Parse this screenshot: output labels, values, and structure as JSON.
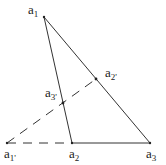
{
  "diagram": {
    "points": {
      "a1": {
        "x": 44,
        "y": 17,
        "label": "a",
        "sub": "1"
      },
      "a2": {
        "x": 72,
        "y": 143,
        "label": "a",
        "sub": "2"
      },
      "a3": {
        "x": 150,
        "y": 143,
        "label": "a",
        "sub": "3"
      },
      "a1p": {
        "x": 7,
        "y": 143,
        "label": "a",
        "sub": "1'"
      },
      "a2p": {
        "x": 96,
        "y": 79,
        "label": "a",
        "sub": "2'"
      },
      "a3p": {
        "x": 63,
        "y": 103,
        "label": "a",
        "sub": "3'"
      }
    },
    "solid_edges": [
      [
        "a1",
        "a2"
      ],
      [
        "a1",
        "a3"
      ],
      [
        "a2",
        "a3"
      ]
    ],
    "dashed_edges": [
      [
        "a1p",
        "a2"
      ],
      [
        "a1p",
        "a2p"
      ]
    ],
    "line_color": "#333333"
  }
}
